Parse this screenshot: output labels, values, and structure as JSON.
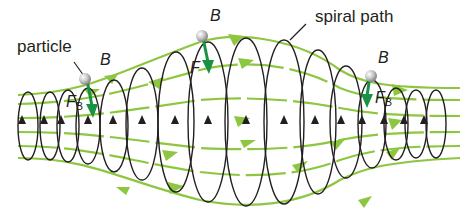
{
  "labels": {
    "particle": "particle",
    "spiral_path": "spiral path",
    "B_left": "B",
    "B_center": "B",
    "B_right": "B",
    "F_left": "F",
    "F_left_sub": "B",
    "F_center": "F",
    "F_right": "F",
    "F_right_sub": "B"
  },
  "colors": {
    "field_line": "#8dc63f",
    "field_arrow": "#8dc63f",
    "spiral": "#231f20",
    "force_arrow": "#1a9245",
    "particle": "#b3b3b3",
    "text": "#231f20"
  },
  "icons": {
    "particle": "gray-sphere",
    "force_vector": "green-down-arrow",
    "field_direction": "green-right-arrowhead",
    "spiral_direction": "black-up-arrowhead"
  }
}
